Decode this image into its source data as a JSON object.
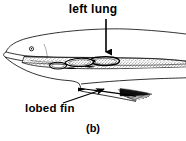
{
  "figure": {
    "caption": "(b)",
    "background_color": "#ffffff",
    "ink_color": "#000000",
    "labels": {
      "left_lung": "left lung",
      "lobed_fin": "lobed fin"
    },
    "annotations": [
      {
        "name": "left-lung",
        "text": "left lung",
        "pointer": "vertical arrow pointing down",
        "target": "left lung organ inside body cavity"
      },
      {
        "name": "lobed-fin",
        "text": "lobed fin",
        "pointer": "diagonal arrow pointing up and to the right",
        "target": "pectoral lobed fin"
      }
    ],
    "parts": [
      "head outline",
      "eye",
      "mouth",
      "dorsal body outline",
      "ventral body outline",
      "stippled body cavity",
      "left lung",
      "visceral organs",
      "lobed fin",
      "fin rays",
      "tapering tail"
    ]
  }
}
